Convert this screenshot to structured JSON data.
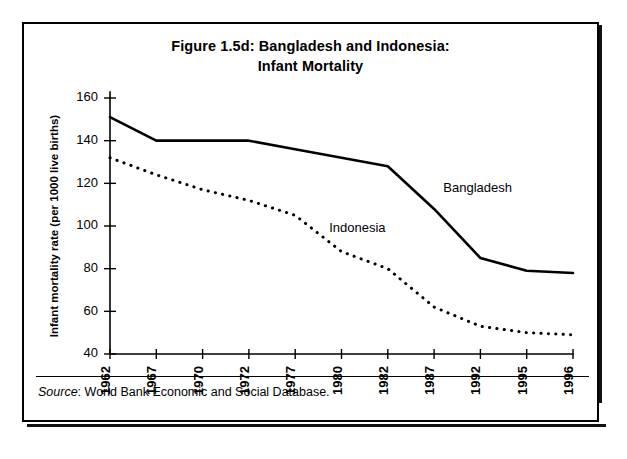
{
  "figure": {
    "title_line1": "Figure 1.5d: Bangladesh and Indonesia:",
    "title_line2": "Infant Mortality",
    "source_label": "Source",
    "source_text": ": World Bank Economic and Social Database."
  },
  "chart_data": {
    "type": "line",
    "title": "Figure 1.5d: Bangladesh and Indonesia: Infant Mortality",
    "xlabel": "",
    "ylabel": "Infant mortality rate (per 1000 live births)",
    "x": [
      1962,
      1967,
      1970,
      1972,
      1977,
      1980,
      1982,
      1987,
      1992,
      1995,
      1996
    ],
    "xtick_labels": [
      "1962",
      "1967",
      "1970",
      "1972",
      "1977",
      "1980",
      "1982",
      "1987",
      "1992",
      "1995",
      "1996"
    ],
    "ylim": [
      40,
      160
    ],
    "yticks": [
      40,
      60,
      80,
      100,
      120,
      140,
      160
    ],
    "ytick_labels": [
      "40",
      "60",
      "80",
      "100",
      "120",
      "140",
      "160"
    ],
    "grid": false,
    "legend": "inline-annotations",
    "series": [
      {
        "name": "Bangladesh",
        "style": "solid",
        "values": [
          151,
          140,
          140,
          140,
          136,
          132,
          128,
          108,
          85,
          79,
          78
        ],
        "annotation": "Bangladesh"
      },
      {
        "name": "Indonesia",
        "style": "dotted",
        "values": [
          132,
          124,
          117,
          112,
          105,
          88,
          80,
          62,
          53,
          50,
          49
        ],
        "annotation": "Indonesia"
      }
    ],
    "annotations": [
      {
        "text": "Bangladesh",
        "x": 1988,
        "y": 116
      },
      {
        "text": "Indonesia",
        "x": 1979.2,
        "y": 97
      }
    ]
  }
}
